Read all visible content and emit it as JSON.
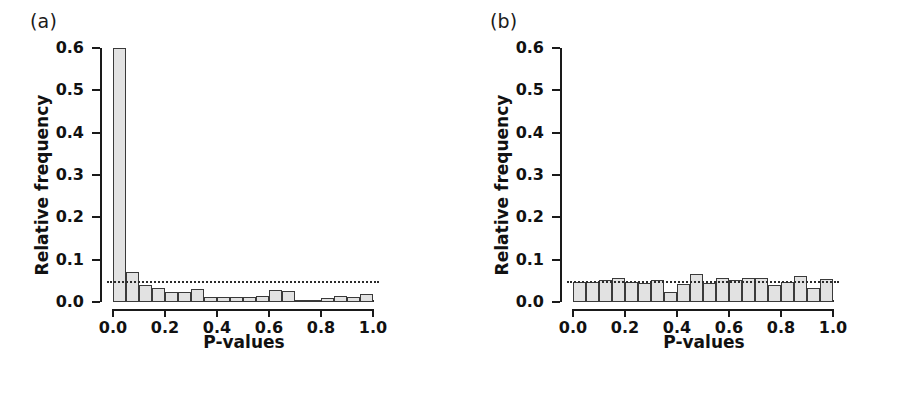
{
  "figure": {
    "panels": [
      {
        "id": "a",
        "label": "(a)",
        "xlabel": "P-values",
        "ylabel": "Relative frequency"
      },
      {
        "id": "b",
        "label": "(b)",
        "xlabel": "P-values",
        "ylabel": "Relative frequency"
      }
    ],
    "ytick_labels": [
      "0.6",
      "0.5",
      "0.4",
      "0.3",
      "0.2",
      "0.1",
      "0.0"
    ],
    "xtick_labels": [
      "0.0",
      "0.2",
      "0.4",
      "0.6",
      "0.8",
      "1.0"
    ],
    "colors": {
      "bar_fill": "#e2e2e2",
      "bar_stroke": "#3a3a3a",
      "axis": "#1a1a1a",
      "refline": "#2b2b2b",
      "background": "#ffffff"
    }
  },
  "chart_data": [
    {
      "type": "bar",
      "id": "a",
      "title": "(a)",
      "xlabel": "P-values",
      "ylabel": "Relative frequency",
      "xlim": [
        0.0,
        1.0
      ],
      "ylim": [
        0.0,
        0.6
      ],
      "yticks": [
        0.0,
        0.1,
        0.2,
        0.3,
        0.4,
        0.5,
        0.6
      ],
      "xticks": [
        0.0,
        0.2,
        0.4,
        0.6,
        0.8,
        1.0
      ],
      "grid": false,
      "legend": "none",
      "bin_width": 0.05,
      "bin_edges": [
        0.0,
        0.05,
        0.1,
        0.15,
        0.2,
        0.25,
        0.3,
        0.35,
        0.4,
        0.45,
        0.5,
        0.55,
        0.6,
        0.65,
        0.7,
        0.75,
        0.8,
        0.85,
        0.9,
        0.95,
        1.0
      ],
      "bin_centers": [
        0.025,
        0.075,
        0.125,
        0.175,
        0.225,
        0.275,
        0.325,
        0.375,
        0.425,
        0.475,
        0.525,
        0.575,
        0.625,
        0.675,
        0.725,
        0.775,
        0.825,
        0.875,
        0.925,
        0.975
      ],
      "values": [
        0.6,
        0.07,
        0.04,
        0.033,
        0.024,
        0.024,
        0.03,
        0.012,
        0.013,
        0.013,
        0.012,
        0.014,
        0.028,
        0.025,
        0.002,
        0.002,
        0.01,
        0.014,
        0.012,
        0.018
      ],
      "annotations": [
        {
          "type": "hline",
          "y": 0.05,
          "style": "dotted",
          "label": "uniform expectation (0.05)"
        }
      ]
    },
    {
      "type": "bar",
      "id": "b",
      "title": "(b)",
      "xlabel": "P-values",
      "ylabel": "Relative frequency",
      "xlim": [
        0.0,
        1.0
      ],
      "ylim": [
        0.0,
        0.6
      ],
      "yticks": [
        0.0,
        0.1,
        0.2,
        0.3,
        0.4,
        0.5,
        0.6
      ],
      "xticks": [
        0.0,
        0.2,
        0.4,
        0.6,
        0.8,
        1.0
      ],
      "grid": false,
      "legend": "none",
      "bin_width": 0.05,
      "bin_edges": [
        0.0,
        0.05,
        0.1,
        0.15,
        0.2,
        0.25,
        0.3,
        0.35,
        0.4,
        0.45,
        0.5,
        0.55,
        0.6,
        0.65,
        0.7,
        0.75,
        0.8,
        0.85,
        0.9,
        0.95,
        1.0
      ],
      "bin_centers": [
        0.025,
        0.075,
        0.125,
        0.175,
        0.225,
        0.275,
        0.325,
        0.375,
        0.425,
        0.475,
        0.525,
        0.575,
        0.625,
        0.675,
        0.725,
        0.775,
        0.825,
        0.875,
        0.925,
        0.975
      ],
      "values": [
        0.048,
        0.047,
        0.052,
        0.056,
        0.048,
        0.044,
        0.052,
        0.024,
        0.042,
        0.066,
        0.044,
        0.056,
        0.052,
        0.056,
        0.056,
        0.041,
        0.048,
        0.062,
        0.034,
        0.054
      ],
      "annotations": [
        {
          "type": "hline",
          "y": 0.05,
          "style": "dotted",
          "label": "uniform expectation (0.05)"
        }
      ]
    }
  ]
}
